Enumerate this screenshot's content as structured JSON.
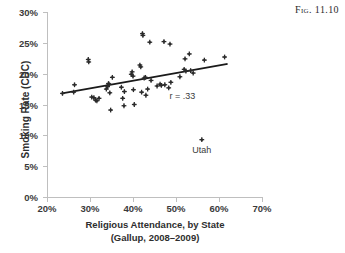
{
  "caption": "Fig. 11.10",
  "axes": {
    "y_title": "Smoking Rate (CDC)",
    "x_title_line1": "Religious Attendance, by State",
    "x_title_line2": "(Gallup, 2008–2009)",
    "y_ticks": [
      "0%",
      "5%",
      "10%",
      "15%",
      "20%",
      "25%",
      "30%"
    ],
    "x_ticks": [
      "20%",
      "30%",
      "40%",
      "50%",
      "60%",
      "70%"
    ]
  },
  "annotations": {
    "correlation": "r = .33",
    "outlier_label": "Utah"
  },
  "colors": {
    "marker": "#2b2b2b",
    "trendline": "#1a1a1a",
    "axis": "#bfbfbf",
    "text": "#2e2e2e",
    "background": "#ffffff"
  },
  "chart_data": {
    "type": "scatter",
    "title": "",
    "xlabel": "Religious Attendance, by State (Gallup, 2008–2009)",
    "ylabel": "Smoking Rate (CDC)",
    "xlim": [
      20,
      70
    ],
    "ylim": [
      0,
      30
    ],
    "xtick_values": [
      20,
      30,
      40,
      50,
      60,
      70
    ],
    "ytick_values": [
      0,
      5,
      10,
      15,
      20,
      25,
      30
    ],
    "grid": false,
    "legend": "none",
    "correlation_r": 0.33,
    "marker_symbol": "plus-star",
    "trendline": {
      "x": [
        23.5,
        62.0
      ],
      "y": [
        16.8,
        21.6
      ]
    },
    "points": [
      {
        "x": 23.6,
        "y": 16.8
      },
      {
        "x": 26.2,
        "y": 17.0
      },
      {
        "x": 26.4,
        "y": 18.2
      },
      {
        "x": 29.6,
        "y": 22.3
      },
      {
        "x": 29.7,
        "y": 21.9
      },
      {
        "x": 30.4,
        "y": 16.2
      },
      {
        "x": 30.9,
        "y": 16.1
      },
      {
        "x": 31.3,
        "y": 15.7
      },
      {
        "x": 31.6,
        "y": 15.6
      },
      {
        "x": 32.1,
        "y": 16.0
      },
      {
        "x": 33.8,
        "y": 17.5
      },
      {
        "x": 34.1,
        "y": 17.9
      },
      {
        "x": 34.3,
        "y": 18.4
      },
      {
        "x": 34.4,
        "y": 18.3
      },
      {
        "x": 34.6,
        "y": 16.9
      },
      {
        "x": 34.8,
        "y": 14.1
      },
      {
        "x": 35.2,
        "y": 19.4
      },
      {
        "x": 37.3,
        "y": 17.8
      },
      {
        "x": 37.6,
        "y": 16.0
      },
      {
        "x": 37.9,
        "y": 14.8
      },
      {
        "x": 38.0,
        "y": 17.1
      },
      {
        "x": 39.6,
        "y": 19.9
      },
      {
        "x": 39.8,
        "y": 20.3
      },
      {
        "x": 40.0,
        "y": 19.6
      },
      {
        "x": 40.1,
        "y": 17.4
      },
      {
        "x": 40.3,
        "y": 15.0
      },
      {
        "x": 41.6,
        "y": 21.4
      },
      {
        "x": 41.8,
        "y": 21.1
      },
      {
        "x": 42.0,
        "y": 17.0
      },
      {
        "x": 42.2,
        "y": 26.5
      },
      {
        "x": 42.3,
        "y": 26.2
      },
      {
        "x": 42.6,
        "y": 19.3
      },
      {
        "x": 42.9,
        "y": 19.4
      },
      {
        "x": 43.0,
        "y": 16.5
      },
      {
        "x": 43.4,
        "y": 17.5
      },
      {
        "x": 43.9,
        "y": 25.1
      },
      {
        "x": 44.2,
        "y": 18.9
      },
      {
        "x": 45.6,
        "y": 18.0
      },
      {
        "x": 46.3,
        "y": 18.3
      },
      {
        "x": 46.6,
        "y": 18.1
      },
      {
        "x": 47.2,
        "y": 25.2
      },
      {
        "x": 47.4,
        "y": 18.2
      },
      {
        "x": 48.3,
        "y": 17.7
      },
      {
        "x": 48.6,
        "y": 24.8
      },
      {
        "x": 48.8,
        "y": 18.6
      },
      {
        "x": 50.9,
        "y": 19.5
      },
      {
        "x": 51.9,
        "y": 20.7
      },
      {
        "x": 52.1,
        "y": 22.4
      },
      {
        "x": 52.3,
        "y": 20.4
      },
      {
        "x": 53.1,
        "y": 23.2
      },
      {
        "x": 53.4,
        "y": 20.5
      },
      {
        "x": 54.0,
        "y": 20.1
      },
      {
        "x": 56.0,
        "y": 9.3,
        "label": "Utah"
      },
      {
        "x": 56.6,
        "y": 22.2
      },
      {
        "x": 61.3,
        "y": 22.7
      }
    ]
  }
}
